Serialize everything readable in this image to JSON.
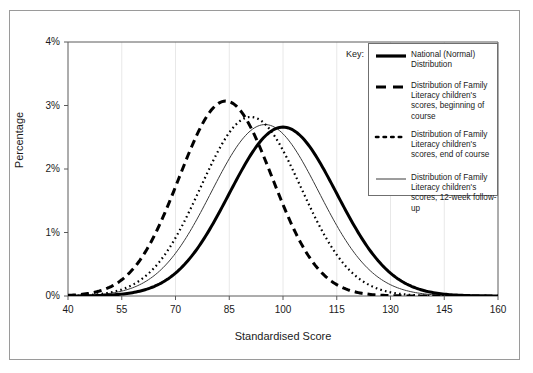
{
  "chart_data": {
    "type": "line",
    "title": "",
    "xlabel": "Standardised Score",
    "ylabel": "Percentage",
    "xlim": [
      40,
      160
    ],
    "ylim": [
      0,
      4
    ],
    "xticks": [
      40,
      55,
      70,
      85,
      100,
      115,
      130,
      145,
      160
    ],
    "xtick_labels": [
      "40",
      "55",
      "70",
      "85",
      "100",
      "115",
      "130",
      "145",
      "160"
    ],
    "yticks": [
      0,
      1,
      2,
      3,
      4
    ],
    "ytick_labels": [
      "0%",
      "1%",
      "2%",
      "3%",
      "4%"
    ],
    "grid": "vertical-light",
    "legend_position": "top-right-inside",
    "series": [
      {
        "name": "National (Normal) Distribution",
        "style": "thick-solid",
        "color": "#000000",
        "mean": 100,
        "sd": 15,
        "peak_percentage": 2.66,
        "x": [
          40,
          45,
          50,
          55,
          60,
          65,
          70,
          75,
          80,
          85,
          90,
          95,
          100,
          105,
          110,
          115,
          120,
          125,
          130,
          135,
          140,
          145,
          150,
          155,
          160
        ],
        "y": [
          0.0,
          0.01,
          0.02,
          0.04,
          0.08,
          0.15,
          0.27,
          0.44,
          0.69,
          0.99,
          1.31,
          1.6,
          1.79,
          1.79,
          1.6,
          1.31,
          0.99,
          0.69,
          0.44,
          0.27,
          0.15,
          0.08,
          0.04,
          0.02,
          0.01
        ]
      },
      {
        "name": "Distribution of Family Literacy children's scores, beginning of course",
        "style": "thick-dashed",
        "color": "#000000",
        "mean": 84,
        "sd": 13,
        "peak_percentage": 3.07,
        "x": [
          40,
          45,
          50,
          55,
          60,
          65,
          70,
          75,
          80,
          85,
          90,
          95,
          100,
          105,
          110,
          115,
          120,
          125,
          130,
          135,
          140,
          145,
          150,
          155,
          160
        ],
        "y": [
          0.02,
          0.06,
          0.15,
          0.34,
          0.68,
          1.21,
          1.89,
          2.56,
          2.98,
          3.0,
          2.62,
          1.99,
          1.33,
          0.78,
          0.4,
          0.18,
          0.07,
          0.02,
          0.01,
          0.0,
          0.0,
          0.0,
          0.0,
          0.0,
          0.0
        ]
      },
      {
        "name": "Distribution of Family Literacy children's scores, end of course",
        "style": "dotted",
        "color": "#000000",
        "mean": 91,
        "sd": 14,
        "peak_percentage": 2.82,
        "x": [
          40,
          45,
          50,
          55,
          60,
          65,
          70,
          75,
          80,
          85,
          90,
          95,
          100,
          105,
          110,
          115,
          120,
          125,
          130,
          135,
          140,
          145,
          150,
          155,
          160
        ],
        "y": [
          0.0,
          0.02,
          0.05,
          0.13,
          0.29,
          0.58,
          1.03,
          1.61,
          2.21,
          2.66,
          2.8,
          2.6,
          2.13,
          1.57,
          1.03,
          0.6,
          0.31,
          0.14,
          0.06,
          0.02,
          0.01,
          0.0,
          0.0,
          0.0,
          0.0
        ]
      },
      {
        "name": "Distribution of Family Literacy children's scores, 12-week follow-up",
        "style": "thin-solid",
        "color": "#3a3a3a",
        "mean": 95,
        "sd": 15,
        "peak_percentage": 2.7,
        "x": [
          40,
          45,
          50,
          55,
          60,
          65,
          70,
          75,
          80,
          85,
          90,
          95,
          100,
          105,
          110,
          115,
          120,
          125,
          130,
          135,
          140,
          145,
          150,
          155,
          160
        ],
        "y": [
          0.0,
          0.01,
          0.03,
          0.07,
          0.15,
          0.3,
          0.55,
          0.92,
          1.39,
          1.89,
          2.3,
          2.52,
          2.45,
          2.13,
          1.67,
          1.18,
          0.74,
          0.42,
          0.21,
          0.09,
          0.04,
          0.01,
          0.0,
          0.0,
          0.0
        ]
      }
    ]
  },
  "legend": {
    "key_label": "Key:",
    "entries": [
      {
        "sample": "thick-solid-line-sample",
        "label": "National (Normal) Distribution"
      },
      {
        "sample": "thick-dashed-line-sample",
        "label": "Distribution of Family Literacy children's scores, beginning of course"
      },
      {
        "sample": "dotted-line-sample",
        "label": "Distribution of Family Literacy children's scores, end of course"
      },
      {
        "sample": "thin-solid-line-sample",
        "label": "Distribution of Family Literacy children's scores, 12-week follow-up"
      }
    ]
  },
  "colors": {
    "frame": "#9a9a9a",
    "axis": "#5a5a5a",
    "grid": "#e8e8e8",
    "text": "#1a1a1a",
    "curve_primary": "#000000",
    "curve_thin": "#3a3a3a"
  }
}
